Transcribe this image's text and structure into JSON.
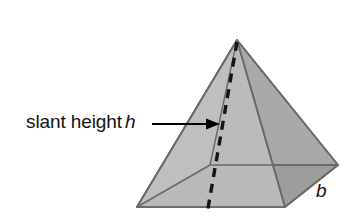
{
  "figure": {
    "kind": "square-pyramid-diagram",
    "background_color": "#ffffff",
    "labels": {
      "slant_height": {
        "prefix": "slant height",
        "variable": "h",
        "icon": "arrow-right-icon",
        "pointer_target": "dashed slant height segment"
      },
      "base": {
        "variable": "b",
        "describes": "base edge length"
      }
    },
    "colors": {
      "face_left_light": "#d9d9d9",
      "face_front_left": "#c9c9c9",
      "face_right_mid": "#a9a9a9",
      "face_base_front": "#a0a0a0",
      "face_base_right": "#9a9a9a",
      "outline": "#6a6a6a",
      "dashed_line": "#1a1a1a",
      "arrow": "#000000",
      "text": "#111111"
    },
    "geometry": {
      "apex": [
        237,
        40
      ],
      "vertex_left": [
        137,
        207
      ],
      "vertex_front": [
        285,
        207
      ],
      "vertex_right": [
        338,
        165
      ],
      "vertex_back_hidden": [
        210,
        165
      ],
      "dashed_from": [
        237,
        42
      ],
      "dashed_to": [
        207,
        213
      ],
      "arrow_from": [
        155,
        124
      ],
      "arrow_to": [
        214,
        124
      ]
    }
  }
}
